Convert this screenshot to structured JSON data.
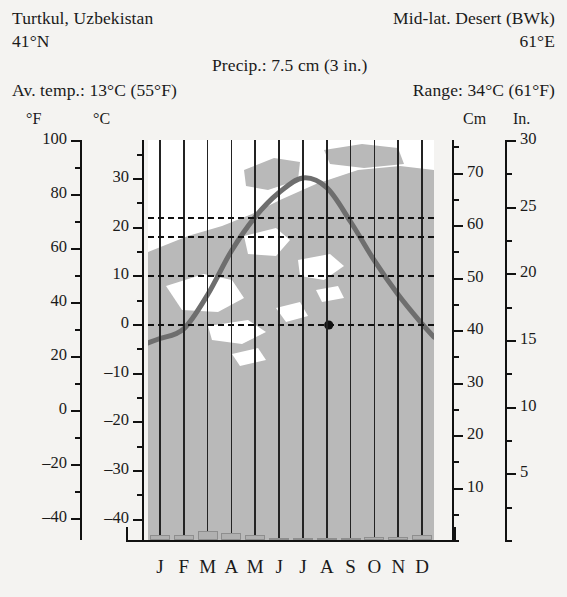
{
  "header": {
    "location": "Turtkul, Uzbekistan",
    "classification": "Mid-lat. Desert (BWk)",
    "latitude": "41°N",
    "longitude": "61°E",
    "precipitation": "Precip.: 7.5 cm (3 in.)",
    "avg_temp": "Av. temp.: 13°C (55°F)",
    "range": "Range: 34°C (61°F)"
  },
  "axis_captions": {
    "fahrenheit": "°F",
    "celsius": "°C",
    "centimeters": "Cm",
    "inches": "In."
  },
  "colors": {
    "background": "#f4f3f1",
    "plot_background": "#ffffff",
    "map_land": "#b9b9b9",
    "temperature_curve": "#6e6e6e",
    "precip_bar": "#b0b0b0",
    "gridline": "#232323",
    "refline": "#111111",
    "text": "#1a1a1a"
  },
  "chart_data": {
    "type": "line",
    "subtitle": "Mid-lat. Desert (BWk)",
    "categories": [
      "J",
      "F",
      "M",
      "A",
      "M",
      "J",
      "J",
      "A",
      "S",
      "O",
      "N",
      "D"
    ],
    "month_labels": [
      "J",
      "F",
      "M",
      "A",
      "M",
      "J",
      "J",
      "A",
      "S",
      "O",
      "N",
      "D"
    ],
    "xlabel": "",
    "grid": true,
    "legend": "none",
    "series": [
      {
        "name": "Average monthly temperature",
        "unit": "°C",
        "render": "line",
        "axis": "left",
        "values": [
          -3,
          -1,
          6,
          15,
          22,
          27,
          30,
          28,
          21,
          13,
          6,
          0
        ]
      },
      {
        "name": "Average monthly precipitation",
        "unit": "cm",
        "render": "bar",
        "axis": "right",
        "values": [
          1.0,
          0.9,
          1.7,
          1.4,
          0.9,
          0.4,
          0.1,
          0.1,
          0.1,
          0.5,
          0.5,
          0.9
        ]
      }
    ],
    "reference_lines": [
      {
        "label": "0°C",
        "value": 0,
        "axis": "celsius",
        "style": "dashed"
      },
      {
        "label": "10°C",
        "value": 10,
        "axis": "celsius",
        "style": "dashed"
      },
      {
        "label": "18°C",
        "value": 18,
        "axis": "celsius",
        "style": "dashed"
      },
      {
        "label": "22°C",
        "value": 22,
        "axis": "celsius",
        "style": "dashed"
      }
    ],
    "axes": {
      "fahrenheit": {
        "label": "°F",
        "side": "left",
        "range": [
          -48,
          100
        ],
        "major_step": 20,
        "minor_step": 10,
        "ticks": [
          100,
          80,
          60,
          40,
          20,
          0,
          -20,
          -40
        ]
      },
      "celsius": {
        "label": "°C",
        "side": "left",
        "range": [
          -44.4,
          37.8
        ],
        "major_step": 10,
        "minor_step": 5,
        "ticks": [
          30,
          20,
          10,
          0,
          -10,
          -20,
          -30,
          -40
        ]
      },
      "centimeters": {
        "label": "Cm",
        "side": "right",
        "range": [
          0,
          76.2
        ],
        "major_step": 10,
        "minor_step": 5,
        "ticks": [
          70,
          60,
          50,
          40,
          30,
          20,
          10
        ]
      },
      "inches": {
        "label": "In.",
        "side": "right",
        "range": [
          0,
          30
        ],
        "major_step": 5,
        "minor_step": 2.5,
        "ticks": [
          30,
          25,
          20,
          15,
          10,
          5
        ]
      }
    },
    "location_marker": {
      "label": "Turtkul",
      "shown": true
    }
  }
}
